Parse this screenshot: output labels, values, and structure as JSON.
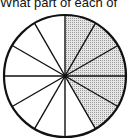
{
  "question": {
    "text": "What part of each of"
  },
  "figure": {
    "type": "circle-fraction",
    "total_sectors": 12,
    "shaded_sectors": 5,
    "shaded_start_deg": 0,
    "shaded_end_deg": 150,
    "shade_color": "#cfcfcf",
    "line_color": "#111111"
  }
}
